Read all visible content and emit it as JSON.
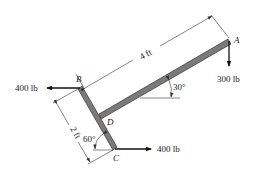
{
  "figure": {
    "points": {
      "A": "A",
      "B": "B",
      "C": "C",
      "D": "D"
    },
    "forces": {
      "at_B": "400 lb",
      "at_C": "400 lb",
      "at_A": "300 lb"
    },
    "dimensions": {
      "DA_length": "4 ft",
      "BC_length": "2 ft"
    },
    "angles": {
      "beam_DA": "30°",
      "member_BC": "60°"
    },
    "colors": {
      "beam": "#7a7a7a",
      "lines": "#111111"
    }
  }
}
